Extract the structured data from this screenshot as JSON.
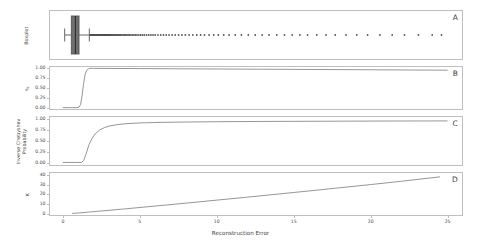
{
  "figure": {
    "width": 481,
    "height": 244,
    "background": "#ffffff",
    "frame_color": "#bfbfbf",
    "line_color": "#8a8a8a",
    "marker_color": "#4d4d4d",
    "box_color": "#555555"
  },
  "xaxis": {
    "label": "Reconstruction Error",
    "ticks": [
      0,
      5,
      10,
      15,
      20,
      25
    ],
    "tick_labels": [
      "0",
      "5",
      "10",
      "15",
      "20",
      "25"
    ],
    "min": -0.9,
    "max": 26.0
  },
  "panels": [
    {
      "letter": "A",
      "ylabel": "Boxplot",
      "ytick_labels": [],
      "yticks": []
    },
    {
      "letter": "B",
      "ylabel": "%",
      "ytick_labels": [
        "1.00",
        "0.75",
        "0.50",
        "0.25",
        "0.00"
      ],
      "yticks": [
        1.0,
        0.75,
        0.5,
        0.25,
        0.0
      ]
    },
    {
      "letter": "C",
      "ylabel": "Inverse Chebyshev Probability",
      "ytick_labels": [
        "1.00",
        "0.75",
        "0.50",
        "0.25",
        "0.00"
      ],
      "yticks": [
        1.0,
        0.75,
        0.5,
        0.25,
        0.0
      ]
    },
    {
      "letter": "D",
      "ylabel": "K",
      "ytick_labels": [
        "40",
        "30",
        "20",
        "10",
        "0"
      ],
      "yticks": [
        40,
        30,
        20,
        10,
        0
      ]
    }
  ],
  "chart_data": [
    {
      "type": "boxplot",
      "panel": "A",
      "title": "",
      "xlabel": "Reconstruction Error",
      "ylabel": "Boxplot",
      "orientation": "horizontal",
      "xlim": [
        -0.9,
        26.0
      ],
      "grid": false,
      "box": {
        "q1": 0.55,
        "median": 0.82,
        "q3": 1.05,
        "whisker_low": 0.12,
        "whisker_high": 1.72
      },
      "outliers": [
        1.78,
        1.82,
        1.86,
        1.9,
        1.94,
        1.98,
        2.02,
        2.06,
        2.1,
        2.14,
        2.18,
        2.22,
        2.26,
        2.3,
        2.34,
        2.38,
        2.42,
        2.46,
        2.5,
        2.54,
        2.58,
        2.62,
        2.66,
        2.7,
        2.74,
        2.78,
        2.82,
        2.86,
        2.9,
        2.94,
        2.98,
        3.02,
        3.06,
        3.1,
        3.16,
        3.22,
        3.28,
        3.34,
        3.4,
        3.46,
        3.52,
        3.58,
        3.64,
        3.7,
        3.76,
        3.84,
        3.92,
        4.0,
        4.08,
        4.16,
        4.24,
        4.32,
        4.42,
        4.52,
        4.62,
        4.72,
        4.82,
        4.94,
        5.06,
        5.18,
        5.3,
        5.44,
        5.58,
        5.72,
        5.86,
        6.0,
        6.18,
        6.36,
        6.54,
        6.72,
        6.9,
        7.1,
        7.3,
        7.52,
        7.74,
        7.96,
        8.2,
        8.45,
        8.7,
        8.95,
        9.2,
        9.5,
        9.8,
        10.1,
        10.45,
        10.8,
        11.2,
        11.6,
        12.05,
        12.5,
        12.95,
        13.4,
        13.9,
        14.4,
        14.9,
        15.4,
        15.9,
        16.5,
        17.1,
        17.7,
        18.4,
        19.1,
        19.8,
        20.6,
        21.4,
        22.2,
        23.1,
        24.0,
        24.6
      ]
    },
    {
      "type": "line",
      "panel": "B",
      "title": "",
      "xlabel": "Reconstruction Error",
      "ylabel": "%",
      "xlim": [
        -0.9,
        26.0
      ],
      "ylim": [
        -0.06,
        1.06
      ],
      "grid": false,
      "description": "Sharp sigmoid step rising from 0.00 near x=1.0 to 1.00 by x=1.7, then slow linear decay to ~0.95 at x=25",
      "x": [
        0.0,
        0.5,
        0.9,
        1.05,
        1.15,
        1.25,
        1.35,
        1.45,
        1.55,
        1.65,
        1.75,
        2.0,
        3.0,
        5.0,
        8.0,
        12.0,
        16.0,
        20.0,
        25.0
      ],
      "y": [
        0.0,
        0.0,
        0.0,
        0.01,
        0.08,
        0.3,
        0.62,
        0.85,
        0.95,
        0.985,
        1.0,
        1.0,
        0.998,
        0.994,
        0.988,
        0.98,
        0.972,
        0.964,
        0.953
      ]
    },
    {
      "type": "line",
      "panel": "C",
      "title": "",
      "xlabel": "Reconstruction Error",
      "ylabel": "Inverse Chebyshev Probability",
      "xlim": [
        -0.9,
        26.0
      ],
      "ylim": [
        -0.06,
        1.06
      ],
      "grid": false,
      "description": "Flat at 0.02 until x=1.3, then smooth concave rise to ~0.90 by x=5, asymptotic approach to 0.95 at x=25",
      "x": [
        0.0,
        0.8,
        1.2,
        1.35,
        1.5,
        1.7,
        1.9,
        2.1,
        2.4,
        2.7,
        3.0,
        3.5,
        4.0,
        5.0,
        6.5,
        8.0,
        10.0,
        13.0,
        17.0,
        21.0,
        25.0
      ],
      "y": [
        0.02,
        0.02,
        0.02,
        0.06,
        0.2,
        0.42,
        0.56,
        0.66,
        0.75,
        0.8,
        0.835,
        0.865,
        0.885,
        0.905,
        0.918,
        0.925,
        0.932,
        0.938,
        0.943,
        0.947,
        0.95
      ]
    },
    {
      "type": "line",
      "panel": "D",
      "title": "",
      "xlabel": "Reconstruction Error",
      "ylabel": "K",
      "xlim": [
        -0.9,
        26.0
      ],
      "ylim": [
        -2.5,
        43.0
      ],
      "grid": false,
      "description": "Near-linear monotonic increase from ~0 at x=0.8 to ~38 at x=24.5",
      "x": [
        0.6,
        1.0,
        2.0,
        4.0,
        6.0,
        8.0,
        10.0,
        12.0,
        14.0,
        16.0,
        18.0,
        20.0,
        22.0,
        24.5
      ],
      "y": [
        0.2,
        0.6,
        2.0,
        4.8,
        7.8,
        10.8,
        13.9,
        17.0,
        20.2,
        23.4,
        26.7,
        30.0,
        33.4,
        38.0
      ]
    }
  ]
}
